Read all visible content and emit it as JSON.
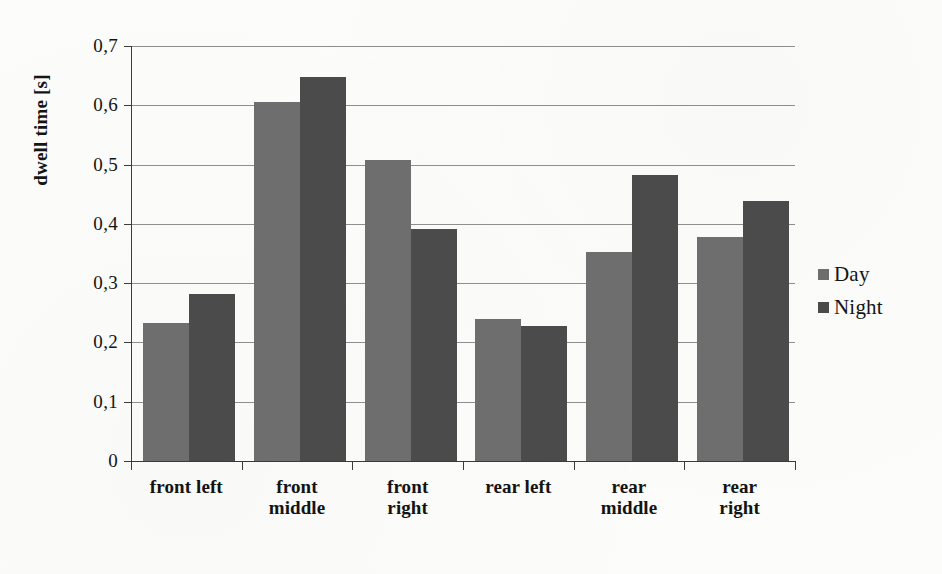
{
  "chart_data": {
    "type": "bar",
    "title": "",
    "xlabel": "",
    "ylabel": "dwell time [s]",
    "ylim": [
      0,
      0.7
    ],
    "ytick_labels": [
      "0,7",
      "0,6",
      "0,5",
      "0,4",
      "0,3",
      "0,2",
      "0,1",
      "0"
    ],
    "ytick_values": [
      0.7,
      0.6,
      0.5,
      0.4,
      0.3,
      0.2,
      0.1,
      0
    ],
    "grid": true,
    "legend_position": "right",
    "decimal_separator": ",",
    "categories": [
      "front left",
      "front middle",
      "front right",
      "rear left",
      "rear middle",
      "rear right"
    ],
    "category_lines": [
      [
        "front left"
      ],
      [
        "front",
        "middle"
      ],
      [
        "front",
        "right"
      ],
      [
        "rear left"
      ],
      [
        "rear",
        "middle"
      ],
      [
        "rear",
        "right"
      ]
    ],
    "series": [
      {
        "name": "Day",
        "color": "#6e6e6e",
        "values": [
          0.232,
          0.605,
          0.508,
          0.239,
          0.353,
          0.378
        ]
      },
      {
        "name": "Night",
        "color": "#4b4b4b",
        "values": [
          0.281,
          0.648,
          0.391,
          0.227,
          0.482,
          0.438
        ]
      }
    ]
  },
  "legend": {
    "items": [
      {
        "label": "Day",
        "color": "#6e6e6e"
      },
      {
        "label": "Night",
        "color": "#4b4b4b"
      }
    ]
  },
  "axis": {
    "y_title": "dwell time [s]"
  }
}
